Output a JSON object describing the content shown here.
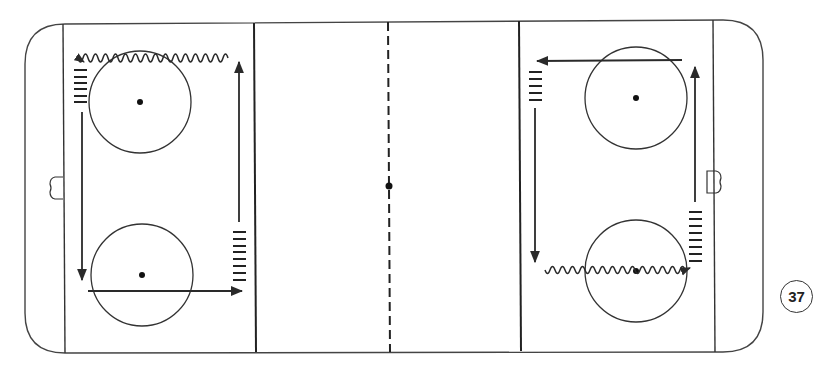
{
  "diagram": {
    "type": "hockey-rink-drill",
    "orientation": "horizontal",
    "colors": {
      "line": "#333333",
      "background": "#ffffff",
      "path": "#2a2a2a"
    },
    "lines": {
      "goal_lines": 2,
      "blue_lines": 2,
      "center_line": "dashed"
    },
    "faceoff_circles": [
      {
        "id": "left-top",
        "zone": "left",
        "position": "top"
      },
      {
        "id": "left-bottom",
        "zone": "left",
        "position": "bottom"
      },
      {
        "id": "right-top",
        "zone": "right",
        "position": "top"
      },
      {
        "id": "right-bottom",
        "zone": "right",
        "position": "bottom"
      }
    ],
    "goal_creases": [
      {
        "side": "left"
      },
      {
        "side": "right"
      }
    ],
    "player_lines": [
      {
        "zone": "left",
        "location": "top-left near goal line",
        "dashes": 6
      },
      {
        "zone": "left",
        "location": "bottom-right near blue line",
        "dashes": 8
      },
      {
        "zone": "right",
        "location": "top-left near blue line",
        "dashes": 5
      },
      {
        "zone": "right",
        "location": "bottom-right near goal line",
        "dashes": 8
      }
    ],
    "paths": [
      {
        "zone": "left",
        "type": "skating",
        "direction": "down",
        "description": "from top-left line down the goal line side"
      },
      {
        "zone": "left",
        "type": "skating",
        "direction": "right",
        "description": "across bottom through lower circle toward blue line"
      },
      {
        "zone": "left",
        "type": "skating",
        "direction": "up",
        "description": "up along blue line side"
      },
      {
        "zone": "left",
        "type": "stickhandling",
        "direction": "left",
        "description": "wavy path across top through upper circle back to start"
      },
      {
        "zone": "right",
        "type": "skating",
        "direction": "left",
        "description": "across top through upper circle toward blue line"
      },
      {
        "zone": "right",
        "type": "skating",
        "direction": "down",
        "description": "down along blue line side"
      },
      {
        "zone": "right",
        "type": "stickhandling",
        "direction": "right",
        "description": "wavy path across bottom through lower circle"
      },
      {
        "zone": "right",
        "type": "skating",
        "direction": "up",
        "description": "up along goal line side"
      }
    ]
  },
  "page": {
    "number": "37"
  },
  "caption": "Hockey drill diagram: circuit skating with stickhandling in both end zones"
}
